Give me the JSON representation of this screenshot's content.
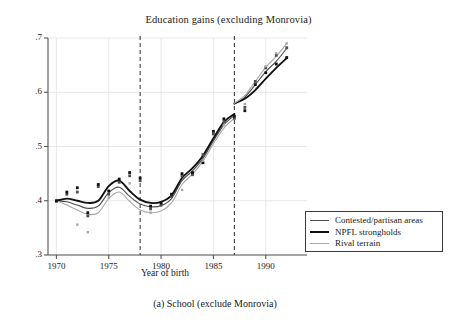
{
  "figure": {
    "title": "Education gains (excluding Monrovia)",
    "caption": "(a) School (exclude Monrovia)"
  },
  "chart_data": {
    "type": "line",
    "title": "Education gains (excluding Monrovia)",
    "xlabel": "Year of birth",
    "ylabel": "",
    "xlim": [
      1969.2,
      1992.6
    ],
    "ylim": [
      0.3,
      0.7
    ],
    "xticks": [
      1970,
      1975,
      1980,
      1985,
      1990
    ],
    "xticklabels": [
      "1970",
      "1975",
      "1980",
      "1985",
      "1990"
    ],
    "yticks": [
      0.3,
      0.4,
      0.5,
      0.6,
      0.7
    ],
    "yticklabels": [
      ".3",
      ".4",
      ".5",
      ".6",
      ".7"
    ],
    "grid": true,
    "legend_position": "bottom-right",
    "vertical_reference_lines": [
      1978,
      1987
    ],
    "colors": {
      "contested": "#4d4d4d",
      "npfl": "#111111",
      "rival": "#a8a8a8",
      "grid": "#e2e2e2",
      "axis": "#555555",
      "reference_line": "#2b2b2b"
    },
    "series": [
      {
        "name": "Contested/partisan areas",
        "color": "#4d4d4d",
        "width": 1.1,
        "x": [
          1970,
          1971,
          1972,
          1973,
          1974,
          1975,
          1976,
          1977,
          1978,
          1979,
          1980,
          1981,
          1982,
          1983,
          1984,
          1985,
          1986,
          1987,
          1988,
          1989,
          1990,
          1991,
          1992
        ],
        "y": [
          0.4,
          0.398,
          0.392,
          0.386,
          0.39,
          0.415,
          0.425,
          0.408,
          0.394,
          0.389,
          0.391,
          0.404,
          0.437,
          0.455,
          0.478,
          0.51,
          0.54,
          0.557,
          0.591,
          0.614,
          0.638,
          0.657,
          0.681
        ],
        "y_post1987": [
          0.591,
          0.614,
          0.638,
          0.657,
          0.681
        ]
      },
      {
        "name": "NPFL strongholds",
        "color": "#111111",
        "width": 1.9,
        "x": [
          1970,
          1971,
          1972,
          1973,
          1974,
          1975,
          1976,
          1977,
          1978,
          1979,
          1980,
          1981,
          1982,
          1983,
          1984,
          1985,
          1986,
          1987,
          1988,
          1989,
          1990,
          1991,
          1992
        ],
        "y": [
          0.4,
          0.404,
          0.4,
          0.396,
          0.4,
          0.427,
          0.437,
          0.418,
          0.402,
          0.396,
          0.398,
          0.41,
          0.442,
          0.46,
          0.483,
          0.515,
          0.545,
          0.56,
          0.588,
          0.604,
          0.625,
          0.645,
          0.663
        ],
        "y_post1987": [
          0.588,
          0.604,
          0.625,
          0.645,
          0.663
        ]
      },
      {
        "name": "Rival terrain",
        "color": "#a8a8a8",
        "width": 1.1,
        "x": [
          1970,
          1971,
          1972,
          1973,
          1974,
          1975,
          1976,
          1977,
          1978,
          1979,
          1980,
          1981,
          1982,
          1983,
          1984,
          1985,
          1986,
          1987,
          1988,
          1989,
          1990,
          1991,
          1992
        ],
        "y": [
          0.4,
          0.392,
          0.383,
          0.375,
          0.378,
          0.404,
          0.416,
          0.399,
          0.383,
          0.378,
          0.381,
          0.396,
          0.43,
          0.449,
          0.473,
          0.505,
          0.534,
          0.552,
          0.594,
          0.62,
          0.646,
          0.666,
          0.69
        ],
        "y_post1987": [
          0.594,
          0.62,
          0.646,
          0.666,
          0.69
        ]
      }
    ],
    "scatter": [
      {
        "name": "Contested/partisan areas",
        "color": "#4d4d4d",
        "points": [
          [
            1970,
            0.399
          ],
          [
            1971,
            0.412
          ],
          [
            1972,
            0.416
          ],
          [
            1973,
            0.372
          ],
          [
            1974,
            0.426
          ],
          [
            1975,
            0.412
          ],
          [
            1976,
            0.434
          ],
          [
            1977,
            0.446
          ],
          [
            1978,
            0.437
          ],
          [
            1979,
            0.385
          ],
          [
            1980,
            0.392
          ],
          [
            1981,
            0.408
          ],
          [
            1982,
            0.446
          ],
          [
            1983,
            0.448
          ],
          [
            1984,
            0.485
          ],
          [
            1985,
            0.523
          ],
          [
            1986,
            0.546
          ],
          [
            1987,
            0.552
          ],
          [
            1988,
            0.572
          ],
          [
            1989,
            0.62
          ],
          [
            1990,
            0.645
          ],
          [
            1991,
            0.668
          ],
          [
            1992,
            0.682
          ]
        ]
      },
      {
        "name": "NPFL strongholds",
        "color": "#111111",
        "points": [
          [
            1970,
            0.4
          ],
          [
            1971,
            0.416
          ],
          [
            1972,
            0.424
          ],
          [
            1973,
            0.378
          ],
          [
            1974,
            0.43
          ],
          [
            1975,
            0.418
          ],
          [
            1976,
            0.44
          ],
          [
            1977,
            0.452
          ],
          [
            1978,
            0.442
          ],
          [
            1979,
            0.39
          ],
          [
            1980,
            0.396
          ],
          [
            1981,
            0.412
          ],
          [
            1982,
            0.45
          ],
          [
            1983,
            0.452
          ],
          [
            1984,
            0.47
          ],
          [
            1985,
            0.528
          ],
          [
            1986,
            0.551
          ],
          [
            1987,
            0.556
          ],
          [
            1988,
            0.566
          ],
          [
            1989,
            0.614
          ],
          [
            1990,
            0.636
          ],
          [
            1991,
            0.652
          ],
          [
            1992,
            0.664
          ]
        ]
      },
      {
        "name": "Rival terrain",
        "color": "#a8a8a8",
        "points": [
          [
            1972,
            0.356
          ],
          [
            1973,
            0.342
          ],
          [
            1975,
            0.406
          ],
          [
            1977,
            0.432
          ],
          [
            1979,
            0.378
          ],
          [
            1982,
            0.42
          ],
          [
            1984,
            0.474
          ],
          [
            1986,
            0.54
          ],
          [
            1988,
            0.578
          ],
          [
            1990,
            0.648
          ],
          [
            1991,
            0.672
          ],
          [
            1992,
            0.69
          ]
        ]
      }
    ],
    "legend": [
      {
        "label": "Contested/partisan areas",
        "color": "#4d4d4d",
        "width": 1.2
      },
      {
        "label": "NPFL strongholds",
        "color": "#111111",
        "width": 2.1
      },
      {
        "label": "Rival terrain",
        "color": "#a8a8a8",
        "width": 1.2
      }
    ]
  }
}
